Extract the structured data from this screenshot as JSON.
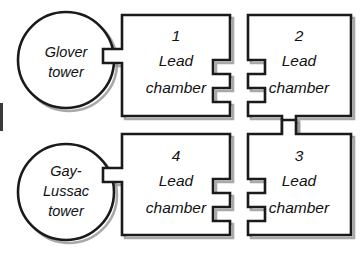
{
  "diagram": {
    "type": "process-flow",
    "stroke_color": "#1a1a1a",
    "shadow_color": "#9a9a9a",
    "fill_color": "#ffffff",
    "background_color": "#ffffff",
    "towers": [
      {
        "id": "glover-tower",
        "lines": [
          "Glover",
          "tower"
        ],
        "line1": "Glover",
        "line2": "tower",
        "line3": "",
        "cx": 66,
        "cy": 60,
        "r": 48
      },
      {
        "id": "gay-lussac-tower",
        "lines": [
          "Gay-",
          "Lussac",
          "tower"
        ],
        "line1": "Gay-",
        "line2": "Lussac",
        "line3": "tower",
        "cx": 66,
        "cy": 192,
        "r": 48
      }
    ],
    "chambers": [
      {
        "id": "chamber-1",
        "number": "1",
        "line1": "Lead",
        "line2": "chamber",
        "position": "top-left"
      },
      {
        "id": "chamber-2",
        "number": "2",
        "line1": "Lead",
        "line2": "chamber",
        "position": "top-right"
      },
      {
        "id": "chamber-3",
        "number": "3",
        "line1": "Lead",
        "line2": "chamber",
        "position": "bottom-right"
      },
      {
        "id": "chamber-4",
        "number": "4",
        "line1": "Lead",
        "line2": "chamber",
        "position": "bottom-left"
      }
    ],
    "connectors": [
      {
        "id": "glover-to-chamber1-upper",
        "from": "glover-tower",
        "to": "chamber-1"
      },
      {
        "id": "glover-to-chamber1-lower",
        "from": "glover-tower",
        "to": "chamber-1"
      },
      {
        "id": "chamber1-to-chamber2-upper",
        "from": "chamber-1",
        "to": "chamber-2"
      },
      {
        "id": "chamber1-to-chamber2-lower",
        "from": "chamber-1",
        "to": "chamber-2"
      },
      {
        "id": "chamber2-to-chamber3",
        "from": "chamber-2",
        "to": "chamber-3"
      },
      {
        "id": "chamber4-to-chamber3-upper",
        "from": "chamber-4",
        "to": "chamber-3"
      },
      {
        "id": "chamber4-to-chamber3-lower",
        "from": "chamber-4",
        "to": "chamber-3"
      },
      {
        "id": "gaylussac-to-chamber4-upper",
        "from": "gay-lussac-tower",
        "to": "chamber-4"
      },
      {
        "id": "gaylussac-to-chamber4-lower",
        "from": "gay-lussac-tower",
        "to": "chamber-4"
      }
    ]
  }
}
